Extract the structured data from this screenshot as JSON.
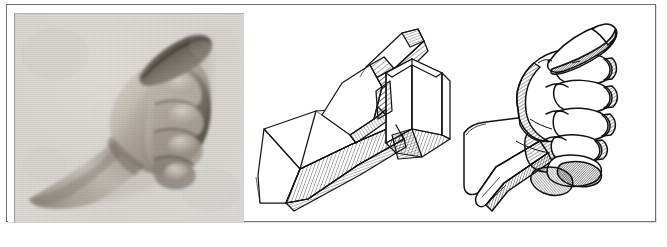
{
  "figure": {
    "title": "Comparative study of the clenched fist",
    "background_color": "#ffffff",
    "frame_color": "#6d6f71",
    "ink_color": "#1a1a1a",
    "panel_count": 3
  },
  "panels": [
    {
      "id": "photograph",
      "kind": "halftone-photograph",
      "label": "Photograph of clenched fist, three-quarter view",
      "subject": "right fist with forearm, thumb uppermost",
      "tone": "black-and-white halftone",
      "background_color": "#dcdcda",
      "skin_mid": "#b9b4ae",
      "skin_shadow": "#4a4540",
      "skin_light": "#e2ded8"
    },
    {
      "id": "block-construction",
      "kind": "line-drawing",
      "label": "Simplified block construction of the same fist",
      "subject": "fist reduced to planar boxes: wedge forearm, box of the fist, slab of the thumb",
      "technique": "pen contour with parallel hatching",
      "ink_color": "#1a1a1a",
      "fill_color": "#ffffff"
    },
    {
      "id": "contour-drawing",
      "kind": "line-drawing",
      "label": "Refined contour drawing of the fist",
      "subject": "fist with individual finger barrels, knuckle ridge, thumb laid over the index finger",
      "technique": "pen contour with cross-hatched shadow",
      "ink_color": "#1a1a1a",
      "fill_color": "#ffffff"
    }
  ]
}
